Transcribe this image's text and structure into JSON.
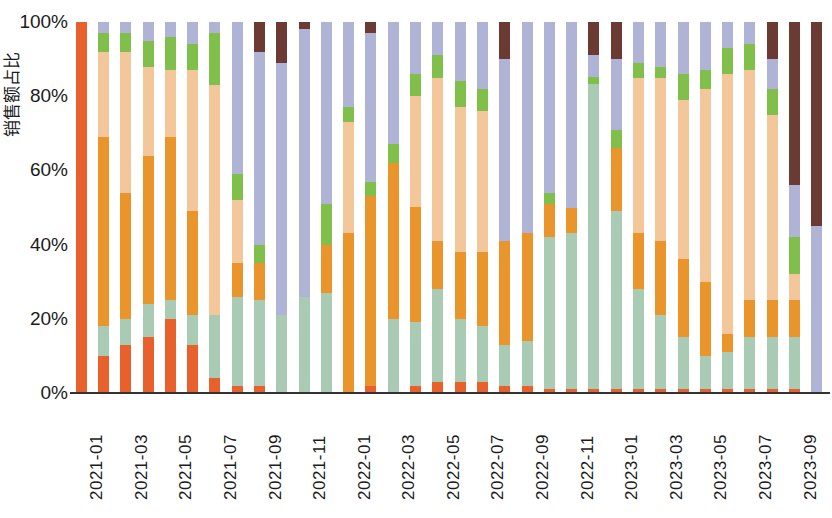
{
  "chart_data": {
    "type": "bar",
    "subtype": "stacked-100-percent",
    "title": "",
    "xlabel": "",
    "ylabel": "销售额占比",
    "ylim": [
      0,
      100
    ],
    "ytick_labels": [
      "0%",
      "20%",
      "40%",
      "60%",
      "80%",
      "100%"
    ],
    "ytick_values": [
      0,
      20,
      40,
      60,
      80,
      100
    ],
    "grid": false,
    "legend": "none",
    "x_tick_step": 2,
    "colors": {
      "s1": "#E8602C",
      "s2": "#A9CBB3",
      "s3": "#E9952B",
      "s4": "#F4C79A",
      "s5": "#7FBF4A",
      "s6": "#AFB4D6",
      "s7": "#6B3A33"
    },
    "series_names": [
      "系列1",
      "系列2",
      "系列3",
      "系列4",
      "系列5",
      "系列6",
      "系列7"
    ],
    "categories": [
      "2021-01",
      "2021-02",
      "2021-03",
      "2021-04",
      "2021-05",
      "2021-06",
      "2021-07",
      "2021-08",
      "2021-09",
      "2021-10",
      "2021-11",
      "2021-12",
      "2022-01",
      "2022-02",
      "2022-03",
      "2022-04",
      "2022-05",
      "2022-06",
      "2022-07",
      "2022-08",
      "2022-09",
      "2022-10",
      "2022-11",
      "2022-12",
      "2023-01",
      "2023-02",
      "2023-03",
      "2023-04",
      "2023-05",
      "2023-06",
      "2023-07",
      "2023-08",
      "2023-09",
      "2023-10"
    ],
    "xtick_labels": [
      "2021-01",
      "",
      "2021-03",
      "",
      "2021-05",
      "",
      "2021-07",
      "",
      "2021-09",
      "",
      "2021-11",
      "",
      "2022-01",
      "",
      "2022-03",
      "",
      "2022-05",
      "",
      "2022-07",
      "",
      "2022-09",
      "",
      "2022-11",
      "",
      "2023-01",
      "",
      "2023-03",
      "",
      "2023-05",
      "",
      "2023-07",
      "",
      "2023-09",
      ""
    ],
    "series": [
      {
        "name": "系列1",
        "color": "#E8602C",
        "values": [
          100,
          10,
          13,
          15,
          20,
          13,
          4,
          2,
          2,
          0,
          0,
          0,
          0,
          2,
          0,
          2,
          3,
          3,
          3,
          2,
          2,
          1,
          1,
          1,
          1,
          1,
          1,
          1,
          1,
          1,
          1,
          1,
          1,
          0
        ]
      },
      {
        "name": "系列2",
        "color": "#A9CBB3",
        "values": [
          0,
          8,
          7,
          9,
          5,
          8,
          17,
          24,
          23,
          21,
          26,
          27,
          0,
          0,
          20,
          17,
          25,
          17,
          15,
          11,
          12,
          41,
          42,
          83,
          48,
          27,
          20,
          14,
          9,
          10,
          14,
          14,
          14,
          0
        ]
      },
      {
        "name": "系列3",
        "color": "#E9952B",
        "values": [
          0,
          51,
          34,
          40,
          44,
          28,
          0,
          9,
          10,
          0,
          0,
          13,
          43,
          51,
          42,
          31,
          13,
          18,
          20,
          28,
          29,
          9,
          7,
          0,
          17,
          15,
          20,
          21,
          20,
          5,
          10,
          10,
          10,
          0
        ]
      },
      {
        "name": "系列4",
        "color": "#F4C79A",
        "values": [
          0,
          23,
          38,
          24,
          18,
          38,
          62,
          17,
          0,
          0,
          0,
          0,
          30,
          0,
          0,
          30,
          44,
          39,
          38,
          0,
          0,
          0,
          0,
          0,
          0,
          42,
          44,
          43,
          52,
          70,
          62,
          50,
          7,
          0
        ]
      },
      {
        "name": "系列5",
        "color": "#7FBF4A",
        "values": [
          0,
          5,
          5,
          7,
          9,
          7,
          14,
          7,
          5,
          0,
          0,
          11,
          4,
          4,
          5,
          6,
          6,
          7,
          6,
          0,
          0,
          3,
          0,
          2,
          5,
          4,
          3,
          7,
          5,
          7,
          7,
          7,
          10,
          0
        ]
      },
      {
        "name": "系列6",
        "color": "#AFB4D6",
        "values": [
          0,
          3,
          3,
          5,
          4,
          6,
          3,
          41,
          52,
          68,
          72,
          49,
          23,
          40,
          33,
          14,
          9,
          16,
          18,
          49,
          57,
          46,
          50,
          6,
          19,
          11,
          12,
          14,
          13,
          7,
          6,
          8,
          14,
          45
        ]
      },
      {
        "name": "系列7",
        "color": "#6B3A33",
        "values": [
          0,
          0,
          0,
          0,
          0,
          0,
          0,
          0,
          8,
          11,
          2,
          0,
          0,
          3,
          0,
          0,
          0,
          0,
          0,
          10,
          0,
          0,
          0,
          9,
          10,
          0,
          0,
          0,
          0,
          0,
          0,
          10,
          44,
          55
        ]
      }
    ]
  }
}
